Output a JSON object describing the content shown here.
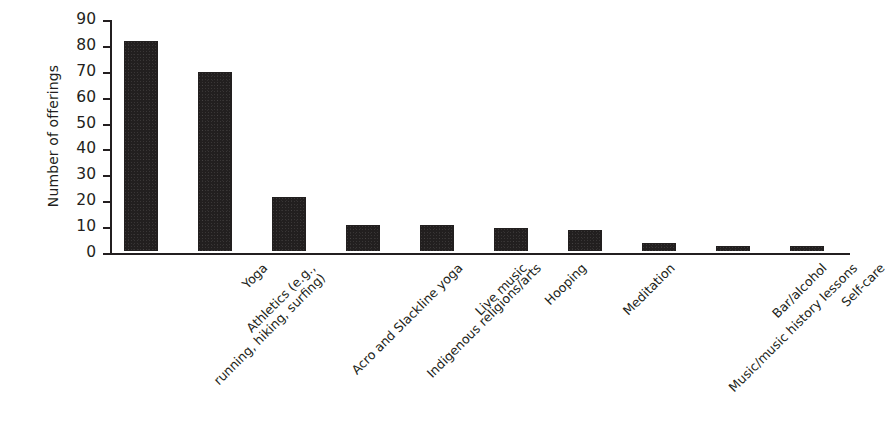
{
  "chart_data": {
    "type": "bar",
    "title": "",
    "xlabel": "",
    "ylabel": "Number of offerings",
    "ylim": [
      0,
      90
    ],
    "ytick_step": 10,
    "yticks": [
      0,
      10,
      20,
      30,
      40,
      50,
      60,
      70,
      80,
      90
    ],
    "grid": false,
    "legend": "none",
    "bar_color": "#221f1f",
    "background_color": "#ffffff",
    "axis_color": "#231f20",
    "label_rotation_deg": -45,
    "categories": [
      "Athletics (e.g., running, hiking, surfing)",
      "Yoga",
      "Acro and Slackline yoga",
      "Indigenous religions/arts",
      "Live music",
      "Hooping",
      "Meditation",
      "Music/music history lessons",
      "Bar/alcohol",
      "Self-care"
    ],
    "category_lines": [
      [
        "Athletics (e.g.,",
        "running, hiking, surfing)"
      ],
      [
        "Yoga"
      ],
      [
        "Acro and Slackline yoga"
      ],
      [
        "Indigenous religions/arts"
      ],
      [
        "Live music"
      ],
      [
        "Hooping"
      ],
      [
        "Meditation"
      ],
      [
        "Music/music history lessons"
      ],
      [
        "Bar/alcohol"
      ],
      [
        "Self-care"
      ]
    ],
    "values": [
      81,
      69,
      21,
      10,
      10,
      9,
      8,
      3,
      2,
      2
    ]
  }
}
